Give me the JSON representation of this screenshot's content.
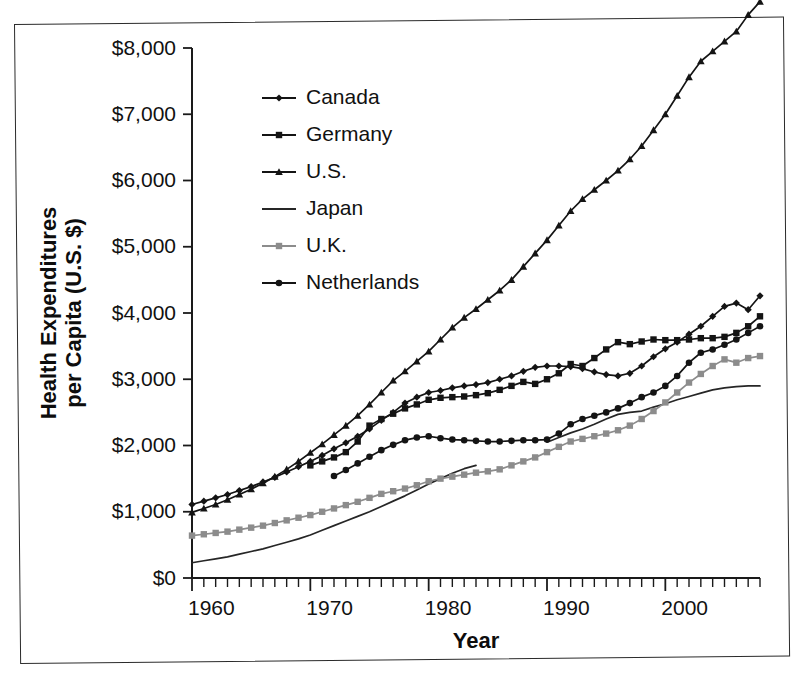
{
  "chart_data": {
    "type": "line",
    "title": "",
    "xlabel": "Year",
    "ylabel": "Health Expenditures per Capita (U.S. $)",
    "xlim": [
      1960,
      2008
    ],
    "ylim": [
      0,
      8000
    ],
    "grid": false,
    "legend_position": "upper-left-inside",
    "y_ticks": [
      0,
      1000,
      2000,
      3000,
      4000,
      5000,
      6000,
      7000,
      8000
    ],
    "y_tick_labels": [
      "$0",
      "$1,000",
      "$2,000",
      "$3,000",
      "$4,000",
      "$5,000",
      "$6,000",
      "$7,000",
      "$8,000"
    ],
    "x_ticks": [
      1960,
      1970,
      1980,
      1990,
      2000
    ],
    "x_tick_labels": [
      "1960",
      "1970",
      "1980",
      "1990",
      "2000"
    ],
    "x_minor_tick_step": 1,
    "series": [
      {
        "name": "Canada",
        "marker": "diamond",
        "color": "#141414",
        "x": [
          1960,
          1961,
          1962,
          1963,
          1964,
          1965,
          1966,
          1967,
          1968,
          1969,
          1970,
          1971,
          1972,
          1973,
          1974,
          1975,
          1976,
          1977,
          1978,
          1979,
          1980,
          1981,
          1982,
          1983,
          1984,
          1985,
          1986,
          1987,
          1988,
          1989,
          1990,
          1991,
          1992,
          1993,
          1994,
          1995,
          1996,
          1997,
          1998,
          1999,
          2000,
          2001,
          2002,
          2003,
          2004,
          2005,
          2006,
          2007,
          2008
        ],
        "y": [
          1110,
          1160,
          1210,
          1260,
          1320,
          1380,
          1450,
          1520,
          1600,
          1680,
          1760,
          1850,
          1950,
          2040,
          2140,
          2250,
          2380,
          2500,
          2640,
          2730,
          2800,
          2830,
          2870,
          2900,
          2920,
          2950,
          3000,
          3050,
          3120,
          3180,
          3200,
          3200,
          3190,
          3160,
          3110,
          3070,
          3050,
          3090,
          3200,
          3340,
          3460,
          3560,
          3680,
          3800,
          3950,
          4100,
          4150,
          4050,
          4260
        ]
      },
      {
        "name": "Germany",
        "marker": "square",
        "color": "#141414",
        "x": [
          1970,
          1971,
          1972,
          1973,
          1974,
          1975,
          1976,
          1977,
          1978,
          1979,
          1980,
          1981,
          1982,
          1983,
          1984,
          1985,
          1986,
          1987,
          1988,
          1989,
          1990,
          1991,
          1992,
          1993,
          1994,
          1995,
          1996,
          1997,
          1998,
          1999,
          2000,
          2001,
          2002,
          2003,
          2004,
          2005,
          2006,
          2007,
          2008
        ],
        "y": [
          1700,
          1760,
          1820,
          1900,
          2060,
          2300,
          2400,
          2480,
          2560,
          2620,
          2690,
          2720,
          2730,
          2740,
          2760,
          2790,
          2840,
          2900,
          2960,
          2930,
          3000,
          3090,
          3230,
          3200,
          3320,
          3450,
          3560,
          3530,
          3570,
          3600,
          3590,
          3590,
          3600,
          3620,
          3620,
          3640,
          3700,
          3800,
          3950
        ]
      },
      {
        "name": "U.S.",
        "marker": "triangle",
        "color": "#141414",
        "x": [
          1960,
          1961,
          1962,
          1963,
          1964,
          1965,
          1966,
          1967,
          1968,
          1969,
          1970,
          1971,
          1972,
          1973,
          1974,
          1975,
          1976,
          1977,
          1978,
          1979,
          1980,
          1981,
          1982,
          1983,
          1984,
          1985,
          1986,
          1987,
          1988,
          1989,
          1990,
          1991,
          1992,
          1993,
          1994,
          1995,
          1996,
          1997,
          1998,
          1999,
          2000,
          2001,
          2002,
          2003,
          2004,
          2005,
          2006,
          2007,
          2008
        ],
        "y": [
          990,
          1050,
          1110,
          1180,
          1260,
          1340,
          1430,
          1530,
          1640,
          1760,
          1890,
          2020,
          2160,
          2300,
          2450,
          2620,
          2800,
          2980,
          3120,
          3270,
          3420,
          3600,
          3780,
          3930,
          4060,
          4200,
          4340,
          4500,
          4700,
          4900,
          5100,
          5320,
          5540,
          5720,
          5860,
          6000,
          6150,
          6320,
          6520,
          6760,
          7000,
          7280,
          7560,
          7800,
          7950,
          8100,
          8250,
          8500,
          8700
        ]
      },
      {
        "name": "Japan",
        "marker": "none",
        "color": "#262626",
        "x": [
          1960,
          1961,
          1962,
          1963,
          1964,
          1965,
          1966,
          1967,
          1968,
          1969,
          1970,
          1971,
          1972,
          1973,
          1974,
          1975,
          1976,
          1977,
          1978,
          1979,
          1980,
          1981,
          1982,
          1983,
          1984
        ],
        "y": [
          230,
          260,
          290,
          320,
          360,
          400,
          440,
          490,
          540,
          590,
          650,
          720,
          790,
          860,
          930,
          1000,
          1080,
          1160,
          1240,
          1330,
          1420,
          1500,
          1580,
          1650,
          1700
        ],
        "segments": [
          {
            "x": [
              1990,
              1991,
              1992,
              1993,
              1994,
              1995,
              1996,
              1997,
              1998,
              1999,
              2000,
              2001,
              2002,
              2003,
              2004,
              2005,
              2006,
              2007,
              2008
            ],
            "y": [
              2050,
              2120,
              2190,
              2250,
              2320,
              2400,
              2470,
              2500,
              2520,
              2580,
              2630,
              2690,
              2740,
              2790,
              2840,
              2870,
              2890,
              2900,
              2900
            ]
          }
        ]
      },
      {
        "name": "U.K.",
        "marker": "square",
        "color": "#8c8c8c",
        "x": [
          1960,
          1961,
          1962,
          1963,
          1964,
          1965,
          1966,
          1967,
          1968,
          1969,
          1970,
          1971,
          1972,
          1973,
          1974,
          1975,
          1976,
          1977,
          1978,
          1979,
          1980,
          1981,
          1982,
          1983,
          1984,
          1985,
          1986,
          1987,
          1988,
          1989,
          1990,
          1991,
          1992,
          1993,
          1994,
          1995,
          1996,
          1997,
          1998,
          1999,
          2000,
          2001,
          2002,
          2003,
          2004,
          2005,
          2006,
          2007,
          2008
        ],
        "y": [
          640,
          660,
          680,
          700,
          730,
          760,
          790,
          830,
          870,
          910,
          950,
          1000,
          1050,
          1100,
          1150,
          1210,
          1270,
          1310,
          1350,
          1400,
          1460,
          1500,
          1530,
          1560,
          1590,
          1610,
          1640,
          1700,
          1760,
          1820,
          1900,
          1980,
          2060,
          2100,
          2140,
          2180,
          2230,
          2300,
          2400,
          2520,
          2650,
          2800,
          2950,
          3080,
          3200,
          3300,
          3250,
          3320,
          3350
        ]
      },
      {
        "name": "Netherlands",
        "marker": "circle",
        "color": "#141414",
        "x": [
          1972,
          1973,
          1974,
          1975,
          1976,
          1977,
          1978,
          1979,
          1980,
          1981,
          1982,
          1983,
          1984,
          1985,
          1986,
          1987,
          1988,
          1989,
          1990,
          1991,
          1992,
          1993,
          1994,
          1995,
          1996,
          1997,
          1998,
          1999,
          2000,
          2001,
          2002,
          2003,
          2004,
          2005,
          2006,
          2007,
          2008
        ],
        "y": [
          1540,
          1630,
          1730,
          1830,
          1930,
          2010,
          2080,
          2120,
          2140,
          2110,
          2090,
          2080,
          2070,
          2060,
          2060,
          2070,
          2080,
          2080,
          2090,
          2180,
          2320,
          2400,
          2450,
          2500,
          2560,
          2640,
          2730,
          2800,
          2900,
          3050,
          3250,
          3400,
          3450,
          3520,
          3600,
          3700,
          3800
        ]
      }
    ]
  }
}
